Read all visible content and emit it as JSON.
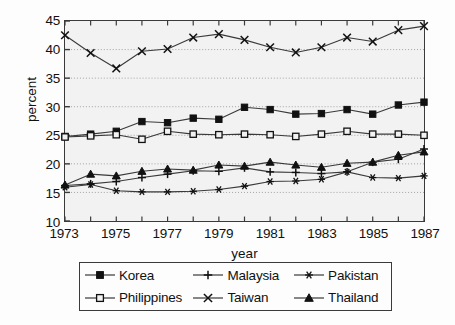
{
  "chart_data": {
    "type": "line",
    "title": "",
    "xlabel": "year",
    "ylabel": "percent",
    "xlim": [
      1973,
      1987
    ],
    "ylim": [
      10,
      45
    ],
    "ytick_step": 5,
    "yticks": [
      10,
      15,
      20,
      25,
      30,
      35,
      40,
      45
    ],
    "grid": true,
    "grid_style": "dotted-horizontal",
    "legend_position": "below",
    "x": [
      1973,
      1974,
      1975,
      1976,
      1977,
      1978,
      1979,
      1980,
      1981,
      1982,
      1983,
      1984,
      1985,
      1986,
      1987
    ],
    "xtick_labels": [
      "1973",
      "",
      "1975",
      "",
      "1977",
      "",
      "1979",
      "",
      "1981",
      "",
      "1983",
      "",
      "1985",
      "",
      "1987"
    ],
    "series": [
      {
        "name": "Korea",
        "marker": "filled-square",
        "values": [
          24.8,
          25.2,
          25.7,
          27.4,
          27.2,
          28.0,
          27.8,
          29.9,
          29.5,
          28.7,
          28.8,
          29.5,
          28.7,
          30.3,
          30.8
        ]
      },
      {
        "name": "Malaysia",
        "marker": "plus",
        "values": [
          16.2,
          16.5,
          16.9,
          17.6,
          18.2,
          18.8,
          18.7,
          19.3,
          18.6,
          18.5,
          18.3,
          18.6,
          20.3,
          20.8,
          22.6
        ]
      },
      {
        "name": "Pakistan",
        "marker": "asterisk",
        "values": [
          15.9,
          16.4,
          15.3,
          15.1,
          15.1,
          15.2,
          15.5,
          16.1,
          16.9,
          17.0,
          17.3,
          18.6,
          17.6,
          17.5,
          17.9
        ]
      },
      {
        "name": "Philippines",
        "marker": "open-square",
        "values": [
          24.7,
          24.9,
          25.1,
          24.3,
          25.7,
          25.2,
          25.1,
          25.2,
          25.1,
          24.8,
          25.2,
          25.7,
          25.2,
          25.2,
          25.0
        ]
      },
      {
        "name": "Taiwan",
        "marker": "cross-x",
        "values": [
          42.5,
          39.4,
          36.7,
          39.7,
          40.1,
          42.1,
          42.7,
          41.7,
          40.4,
          39.5,
          40.4,
          42.1,
          41.4,
          43.4,
          44.1
        ]
      },
      {
        "name": "Thailand",
        "marker": "filled-triangle",
        "values": [
          16.3,
          18.2,
          17.9,
          18.7,
          19.1,
          18.9,
          19.8,
          19.6,
          20.3,
          19.8,
          19.4,
          20.1,
          20.3,
          21.5,
          22.1
        ]
      }
    ]
  },
  "legend": {
    "rows": [
      [
        {
          "name": "Korea",
          "marker": "filled-square"
        },
        {
          "name": "Malaysia",
          "marker": "plus"
        },
        {
          "name": "Pakistan",
          "marker": "asterisk"
        }
      ],
      [
        {
          "name": "Philippines",
          "marker": "open-square"
        },
        {
          "name": "Taiwan",
          "marker": "cross-x"
        },
        {
          "name": "Thailand",
          "marker": "filled-triangle"
        }
      ]
    ]
  },
  "colors": {
    "line": "#3a3a3a",
    "marker_fill": "#111111",
    "marker_open_fill": "#f2f2f2",
    "plot_background": "#f2f2f2",
    "frame": "#3a3a3a",
    "grid": "#9a9a9a",
    "text": "#111111"
  }
}
